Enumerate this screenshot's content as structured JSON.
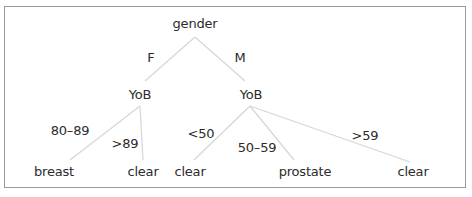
{
  "diagram": {
    "type": "decision-tree",
    "colors": {
      "edge": "#d6d6d6",
      "text": "#2b2b2b",
      "border": "#9a9a9a"
    },
    "root": {
      "label": "gender"
    },
    "branches": {
      "female": {
        "edge_label": "F",
        "node_label": "YoB",
        "children": [
          {
            "edge_label": "80–89",
            "leaf_label": "breast"
          },
          {
            "edge_label": ">89",
            "leaf_label": "clear"
          }
        ]
      },
      "male": {
        "edge_label": "M",
        "node_label": "YoB",
        "children": [
          {
            "edge_label": "<50",
            "leaf_label": "clear"
          },
          {
            "edge_label": "50–59",
            "leaf_label": "prostate"
          },
          {
            "edge_label": ">59",
            "leaf_label": "clear"
          }
        ]
      }
    }
  }
}
